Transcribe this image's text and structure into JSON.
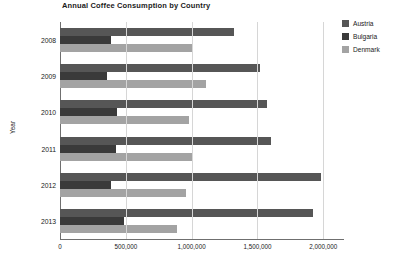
{
  "chart_data": {
    "type": "bar",
    "orientation": "horizontal",
    "title": "Annual Coffee Consumption by Country",
    "xlabel": "",
    "ylabel": "Year",
    "categories": [
      "2008",
      "2009",
      "2010",
      "2011",
      "2012",
      "2013"
    ],
    "series": [
      {
        "name": "Austria",
        "color": "#565656",
        "values": [
          1320000,
          1520000,
          1570000,
          1600000,
          1980000,
          1920000
        ]
      },
      {
        "name": "Bulgaria",
        "color": "#3a3a3a",
        "values": [
          390000,
          355000,
          430000,
          425000,
          390000,
          485000
        ]
      },
      {
        "name": "Denmark",
        "color": "#a3a3a3",
        "values": [
          1000000,
          1110000,
          980000,
          1000000,
          960000,
          890000
        ]
      }
    ],
    "xlim": [
      0,
      2150000
    ],
    "xticks": [
      0,
      500000,
      1000000,
      1500000,
      2000000
    ],
    "xtick_labels": [
      "0",
      "500,000",
      "1,000,000",
      "1,500,000",
      "2,000,000"
    ],
    "grid": true,
    "legend_position": "right",
    "legend_entries": [
      "Austria",
      "Bulgaria",
      "Denmark"
    ]
  }
}
